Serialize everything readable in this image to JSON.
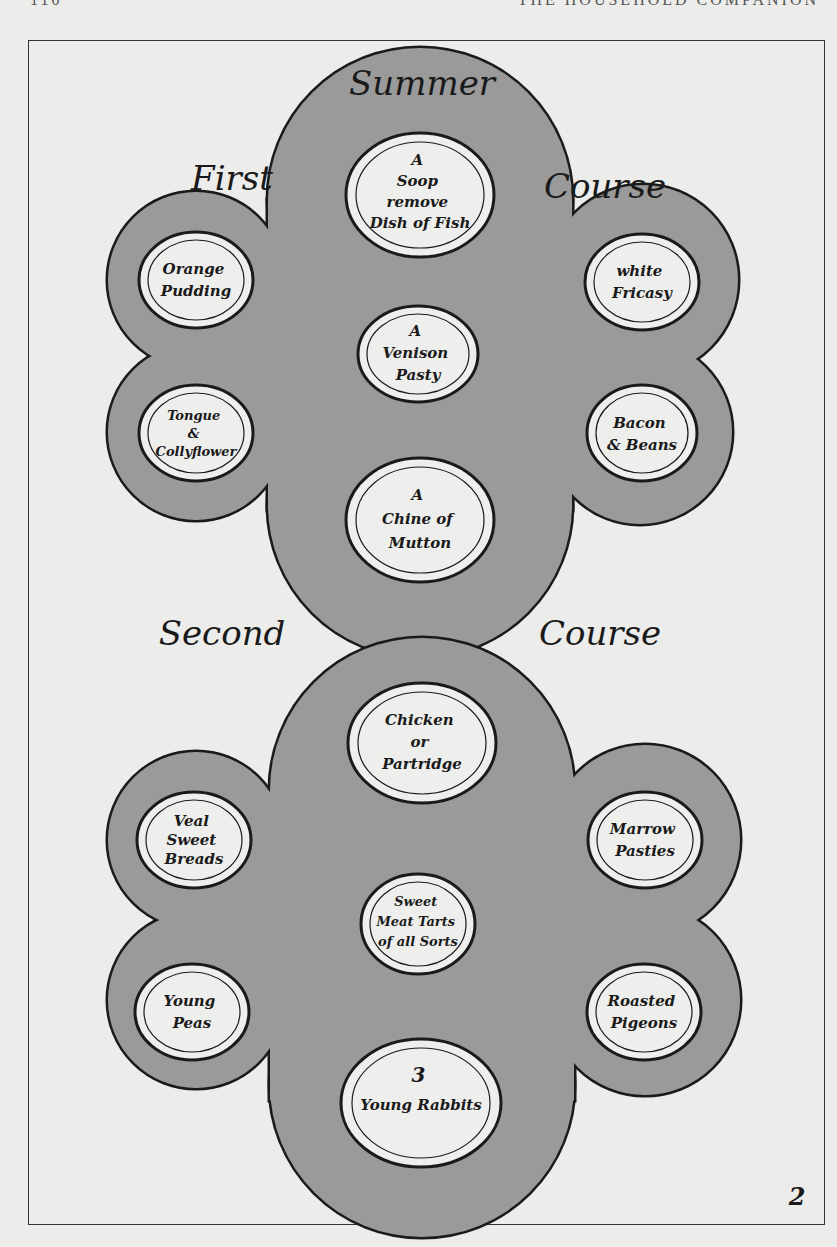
{
  "running_head": {
    "page": "110",
    "title": "THE HOUSEHOLD COMPANION"
  },
  "title": "Summer",
  "colors": {
    "table": "#9a9a9a",
    "outline": "#1a1a1a",
    "plate": "#eeeeec",
    "paper": "#ececeb"
  },
  "first_course": {
    "label_left": "First",
    "label_right": "Course",
    "dishes": [
      {
        "position": "top-center",
        "lines": [
          "A",
          "Soop",
          "remove",
          "Dish of Fish"
        ]
      },
      {
        "position": "upper-left",
        "lines": [
          "Orange",
          "Pudding"
        ]
      },
      {
        "position": "upper-right",
        "lines": [
          "white",
          "Fricasy"
        ]
      },
      {
        "position": "center",
        "lines": [
          "A",
          "Venison",
          "Pasty"
        ]
      },
      {
        "position": "lower-left",
        "lines": [
          "Tongue",
          "&",
          "Collyflower"
        ]
      },
      {
        "position": "lower-right",
        "lines": [
          "Bacon",
          "& Beans"
        ]
      },
      {
        "position": "bottom-center",
        "lines": [
          "A",
          "Chine of",
          "Mutton"
        ]
      }
    ]
  },
  "second_course": {
    "label_left": "Second",
    "label_right": "Course",
    "dishes": [
      {
        "position": "top-center",
        "lines": [
          "Chicken",
          "or",
          "Partridge"
        ]
      },
      {
        "position": "upper-left",
        "lines": [
          "Veal",
          "Sweet",
          "Breads"
        ]
      },
      {
        "position": "upper-right",
        "lines": [
          "Marrow",
          "Pasties"
        ]
      },
      {
        "position": "center",
        "lines": [
          "Sweet",
          "Meat Tarts",
          "of all Sorts"
        ]
      },
      {
        "position": "lower-left",
        "lines": [
          "Young",
          "Peas"
        ]
      },
      {
        "position": "lower-right",
        "lines": [
          "Roasted",
          "Pigeons"
        ]
      },
      {
        "position": "bottom-center",
        "lines": [
          "3",
          "Young Rabbits"
        ]
      }
    ]
  },
  "plate_number": "2"
}
